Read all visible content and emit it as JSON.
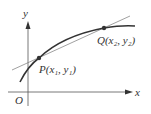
{
  "diagram": {
    "type": "secant-line-on-curve",
    "axes": {
      "x_label": "x",
      "y_label": "y",
      "origin_label": "O"
    },
    "points": [
      {
        "name": "P",
        "label": "P(x₁, y₁)",
        "x_sym": "x₁",
        "y_sym": "y₁"
      },
      {
        "name": "Q",
        "label": "Q(x₂, y₂)",
        "x_sym": "x₂",
        "y_sym": "y₂"
      }
    ],
    "elements": [
      "concave-down curve",
      "secant line through P and Q"
    ],
    "colors": {
      "curve": "#333333",
      "secant": "#777777",
      "axes": "#555555",
      "point": "#333333"
    }
  }
}
